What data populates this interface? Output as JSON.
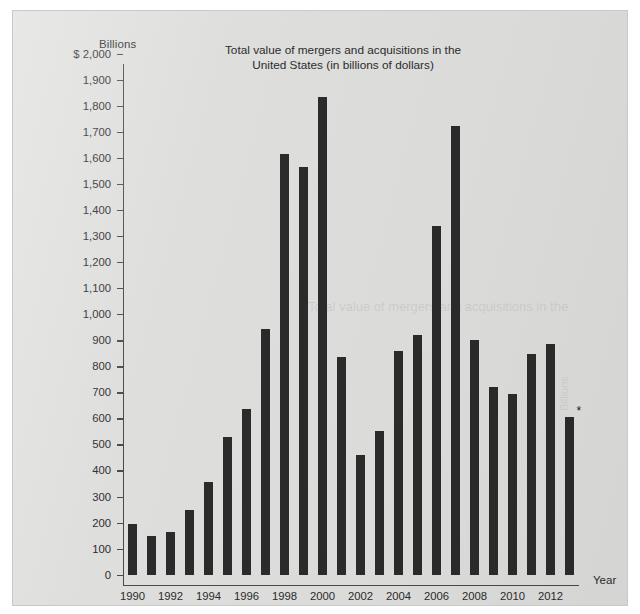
{
  "chart_data": {
    "type": "bar",
    "title": "Total value of mergers and acquisitions in the United States (in billions of dollars)",
    "title_line1": "Total value of mergers and acquisitions in the",
    "title_line2": "United States (in billions of dollars)",
    "ylabel": "Billions",
    "xlabel": "Year",
    "y_axis_prefix": "$",
    "ylim": [
      0,
      2000
    ],
    "grid": false,
    "legend": null,
    "bar_color": "#2b2b2b",
    "background_color": "#dededd",
    "categories": [
      "1990",
      "1991",
      "1992",
      "1993",
      "1994",
      "1995",
      "1996",
      "1997",
      "1998",
      "1999",
      "2000",
      "2001",
      "2002",
      "2003",
      "2004",
      "2005",
      "2006",
      "2007",
      "2008",
      "2009",
      "2010",
      "2011",
      "2012",
      "2013"
    ],
    "values": [
      196,
      150,
      165,
      248,
      355,
      527,
      637,
      944,
      1617,
      1567,
      1835,
      835,
      458,
      553,
      860,
      920,
      1340,
      1723,
      903,
      722,
      695,
      848,
      885,
      605
    ],
    "x_tick_labels": [
      "1990",
      "1992",
      "1994",
      "1996",
      "1998",
      "2000",
      "2002",
      "2004",
      "2006",
      "2008",
      "2010",
      "2012"
    ],
    "y_tick_labels": [
      "$ 2,000",
      "1,900",
      "1,800",
      "1,700",
      "1,600",
      "1,500",
      "1,400",
      "1,300",
      "1,200",
      "1,100",
      "1,000",
      "900",
      "800",
      "700",
      "600",
      "500",
      "400",
      "300",
      "200",
      "100",
      "0"
    ],
    "y_tick_values": [
      2000,
      1900,
      1800,
      1700,
      1600,
      1500,
      1400,
      1300,
      1200,
      1100,
      1000,
      900,
      800,
      700,
      600,
      500,
      400,
      300,
      200,
      100,
      0
    ],
    "annotations": [
      {
        "text": "*",
        "category": "2013",
        "note": "asterisk marker above final bar"
      }
    ]
  },
  "ghost_text": {
    "line1": "Total value of mergers and acquisitions in the",
    "side": "Billions"
  }
}
